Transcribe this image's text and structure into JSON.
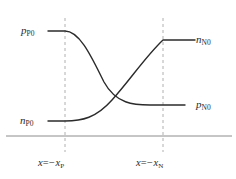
{
  "figure": {
    "width": 236,
    "height": 179,
    "background_color": "#ffffff",
    "curve_color": "#2b2b2b",
    "dashed_line_color": "#b0b0b0",
    "baseline_color": "#8c8c8c",
    "text_color": "#2b2b2b"
  },
  "labels": {
    "p_P0": {
      "symbol": "p",
      "subscript": "P0"
    },
    "n_P0": {
      "symbol": "n",
      "subscript": "P0"
    },
    "n_N0": {
      "symbol": "n",
      "subscript": "N0"
    },
    "p_N0": {
      "symbol": "p",
      "subscript": "N0"
    },
    "x_P": {
      "lead": "x",
      "eq": "=−",
      "symbol": "x",
      "subscript": "P"
    },
    "x_N": {
      "lead": "x",
      "eq": "=−",
      "symbol": "x",
      "subscript": "N"
    }
  },
  "chart_data": {
    "type": "line",
    "xlabel": "",
    "ylabel": "",
    "grid": false,
    "legend": "none",
    "xlim": [
      0,
      236
    ],
    "ylim": [
      179,
      0
    ],
    "annotations": [
      {
        "name": "p_P0",
        "text": "p_P0",
        "x": 21,
        "y": 25
      },
      {
        "name": "n_P0",
        "text": "n_P0",
        "x": 20,
        "y": 115
      },
      {
        "name": "n_N0",
        "text": "n_N0",
        "x": 196,
        "y": 34
      },
      {
        "name": "p_N0",
        "text": "p_N0",
        "x": 196,
        "y": 99
      },
      {
        "name": "x_P",
        "text": "x = -x_P",
        "x": 38,
        "y": 158
      },
      {
        "name": "x_N",
        "text": "x = -x_N",
        "x": 136,
        "y": 158
      }
    ],
    "vertical_lines": [
      {
        "name": "depletion-edge-p",
        "x": 65,
        "y_top": 18,
        "y_bottom": 152,
        "style": "dashed"
      },
      {
        "name": "depletion-edge-n",
        "x": 163,
        "y_top": 18,
        "y_bottom": 152,
        "style": "dashed"
      }
    ],
    "baseline": {
      "name": "x-axis",
      "y": 136,
      "x_start": 6,
      "x_end": 232
    },
    "series": [
      {
        "name": "hole-concentration",
        "label": "p",
        "plateau_left_y": 31,
        "plateau_right_y": 105,
        "path": "M 48 31 L 65 31 C 80 31 92 58 104 82 C 116 104 134 105 150 105 L 185 105"
      },
      {
        "name": "electron-concentration",
        "label": "n",
        "plateau_left_y": 121,
        "plateau_right_y": 40,
        "path": "M 48 121 L 65 121 C 82 121 96 118 112 100 C 130 80 146 56 163 40 L 195 40"
      }
    ],
    "crossing_point": {
      "x": 113,
      "y": 95
    }
  }
}
